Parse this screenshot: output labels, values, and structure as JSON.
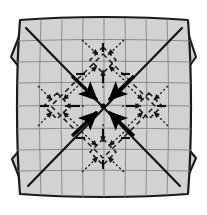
{
  "figure": {
    "type": "diagram",
    "width": 207,
    "height": 215,
    "background_color": "#ffffff",
    "mesh_fill_color": "#d2d2d2",
    "mesh_grid_color": "#808080",
    "outline_color": "#1a1a1a",
    "arrow_color": "#000000",
    "dashed_color": "#1a1a1a"
  },
  "body": {
    "name": "central-quad-mesh",
    "description": "Slightly barrel-distorted square plate subdivided into an 8 by 8 grid of quadrilateral elements",
    "grid_columns": 8,
    "grid_rows": 8,
    "bounds": {
      "left": 18,
      "top": 18,
      "right": 190,
      "bottom": 196
    }
  },
  "arms": [
    {
      "name": "arm-top-left",
      "direction": "northwest",
      "tip_x": 12,
      "tip_y": 14
    },
    {
      "name": "arm-top-right",
      "direction": "northeast",
      "tip_x": 196,
      "tip_y": 14
    },
    {
      "name": "arm-bottom-left",
      "direction": "southwest",
      "tip_x": 12,
      "tip_y": 200
    },
    {
      "name": "arm-bottom-right",
      "direction": "southeast",
      "tip_x": 196,
      "tip_y": 200
    }
  ],
  "center_arrows": {
    "name": "convergent-load-arrows",
    "count": 4,
    "style": "solid-bold",
    "target_x": 103,
    "target_y": 106,
    "directions": [
      "from-upper-left",
      "from-upper-right",
      "from-lower-left",
      "from-lower-right"
    ]
  },
  "satellite_cells": [
    {
      "name": "satellite-top",
      "cx": 103,
      "cy": 60,
      "style": "dashed-diamond"
    },
    {
      "name": "satellite-left",
      "cx": 57,
      "cy": 106,
      "style": "dashed-diamond"
    },
    {
      "name": "satellite-right",
      "cx": 149,
      "cy": 106,
      "style": "dashed-diamond"
    },
    {
      "name": "satellite-bottom",
      "cx": 103,
      "cy": 152,
      "style": "dashed-diamond"
    }
  ],
  "dotted_arrows": {
    "name": "secondary-convergent-arrows",
    "style": "dotted-thin",
    "count": 16,
    "description": "Thin dotted arrows converging toward each satellite cell center"
  },
  "tick_marks": {
    "name": "short-bar-markers",
    "count": 16,
    "description": "Short heavy bar markers placed radially around center and satellites"
  }
}
